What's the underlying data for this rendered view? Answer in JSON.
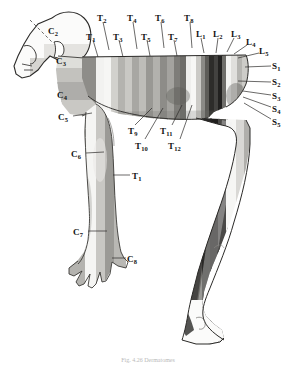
{
  "figure": {
    "background_color": "#ffffff",
    "ink_color": "#141414"
  },
  "caption": {
    "text": "Fig. 4.26  Dermatomes"
  },
  "labels": [
    {
      "id": "C2",
      "root": "C",
      "index": "2",
      "text": "C",
      "sub": "2",
      "x": 48,
      "y": 27,
      "region": "head-scalp",
      "leader": null
    },
    {
      "id": "C3",
      "root": "C",
      "index": "3",
      "text": "C",
      "sub": "3",
      "x": 56,
      "y": 57,
      "region": "neck",
      "leader": null
    },
    {
      "id": "C4",
      "root": "C",
      "index": "4",
      "text": "C",
      "sub": "4",
      "x": 57,
      "y": 91,
      "region": "shoulder-cape",
      "leader": null
    },
    {
      "id": "C5",
      "root": "C",
      "index": "5",
      "text": "C",
      "sub": "5",
      "x": 58,
      "y": 113,
      "region": "upper-arm-lateral",
      "leader": {
        "x1": 73,
        "y1": 116,
        "x2": 92,
        "y2": 113
      }
    },
    {
      "id": "C6",
      "root": "C",
      "index": "6",
      "text": "C",
      "sub": "6",
      "x": 71,
      "y": 150,
      "region": "forearm-radial",
      "leader": {
        "x1": 86,
        "y1": 153,
        "x2": 104,
        "y2": 152
      }
    },
    {
      "id": "C7",
      "root": "C",
      "index": "7",
      "text": "C",
      "sub": "7",
      "x": 73,
      "y": 228,
      "region": "hand-middle",
      "leader": {
        "x1": 88,
        "y1": 231,
        "x2": 107,
        "y2": 231
      }
    },
    {
      "id": "C8",
      "root": "C",
      "index": "8",
      "text": "C",
      "sub": "8",
      "x": 127,
      "y": 255,
      "region": "hand-ulnar",
      "leader": {
        "x1": 112,
        "y1": 258,
        "x2": 126,
        "y2": 258
      }
    },
    {
      "id": "T1",
      "root": "T",
      "index": "1",
      "text": "T",
      "sub": "1",
      "x": 86,
      "y": 33,
      "region": "trunk-band",
      "leader": {
        "x1": 93,
        "y1": 40,
        "x2": 98,
        "y2": 57
      }
    },
    {
      "id": "T2",
      "root": "T",
      "index": "2",
      "text": "T",
      "sub": "2",
      "x": 97,
      "y": 14,
      "region": "trunk-band",
      "leader": {
        "x1": 103,
        "y1": 22,
        "x2": 109,
        "y2": 50
      }
    },
    {
      "id": "T3",
      "root": "T",
      "index": "3",
      "text": "T",
      "sub": "3",
      "x": 113,
      "y": 33,
      "region": "trunk-band",
      "leader": {
        "x1": 119,
        "y1": 40,
        "x2": 123,
        "y2": 57
      }
    },
    {
      "id": "T4",
      "root": "T",
      "index": "4",
      "text": "T",
      "sub": "4",
      "x": 127,
      "y": 14,
      "region": "trunk-band",
      "leader": {
        "x1": 133,
        "y1": 22,
        "x2": 137,
        "y2": 49
      }
    },
    {
      "id": "T5",
      "root": "T",
      "index": "5",
      "text": "T",
      "sub": "5",
      "x": 141,
      "y": 33,
      "region": "trunk-band",
      "leader": {
        "x1": 147,
        "y1": 40,
        "x2": 150,
        "y2": 56
      }
    },
    {
      "id": "T6",
      "root": "T",
      "index": "6",
      "text": "T",
      "sub": "6",
      "x": 155,
      "y": 14,
      "region": "trunk-band",
      "leader": {
        "x1": 161,
        "y1": 22,
        "x2": 164,
        "y2": 48
      }
    },
    {
      "id": "T7",
      "root": "T",
      "index": "7",
      "text": "T",
      "sub": "7",
      "x": 168,
      "y": 33,
      "region": "trunk-band",
      "leader": {
        "x1": 174,
        "y1": 40,
        "x2": 177,
        "y2": 56
      }
    },
    {
      "id": "T8",
      "root": "T",
      "index": "8",
      "text": "T",
      "sub": "8",
      "x": 184,
      "y": 14,
      "region": "trunk-band",
      "leader": {
        "x1": 190,
        "y1": 22,
        "x2": 192,
        "y2": 48
      }
    },
    {
      "id": "T9",
      "root": "T",
      "index": "9",
      "text": "T",
      "sub": "9",
      "x": 128,
      "y": 127,
      "region": "abdomen-band",
      "leader": {
        "x1": 135,
        "y1": 125,
        "x2": 152,
        "y2": 108
      }
    },
    {
      "id": "T10",
      "root": "T",
      "index": "10",
      "text": "T",
      "sub": "10",
      "x": 135,
      "y": 142,
      "region": "abdomen-band",
      "leader": {
        "x1": 145,
        "y1": 139,
        "x2": 163,
        "y2": 108
      }
    },
    {
      "id": "T11",
      "root": "T",
      "index": "11",
      "text": "T",
      "sub": "11",
      "x": 160,
      "y": 127,
      "region": "abdomen-band",
      "leader": {
        "x1": 172,
        "y1": 125,
        "x2": 182,
        "y2": 105
      }
    },
    {
      "id": "T12",
      "root": "T",
      "index": "12",
      "text": "T",
      "sub": "12",
      "x": 168,
      "y": 142,
      "region": "abdomen-band",
      "leader": {
        "x1": 180,
        "y1": 139,
        "x2": 192,
        "y2": 105
      }
    },
    {
      "id": "TL1",
      "root": "T",
      "index": "1",
      "text": "T",
      "sub": "1",
      "x": 132,
      "y": 172,
      "region": "arm-medial-T1",
      "leader": {
        "x1": 130,
        "y1": 175,
        "x2": 113,
        "y2": 175
      }
    },
    {
      "id": "L1",
      "root": "L",
      "index": "1",
      "text": "L",
      "sub": "1",
      "x": 196,
      "y": 30,
      "region": "hip-band",
      "leader": {
        "x1": 201,
        "y1": 38,
        "x2": 204,
        "y2": 53
      }
    },
    {
      "id": "L2",
      "root": "L",
      "index": "2",
      "text": "L",
      "sub": "2",
      "x": 213,
      "y": 30,
      "region": "hip-band",
      "leader": {
        "x1": 218,
        "y1": 38,
        "x2": 216,
        "y2": 53
      }
    },
    {
      "id": "L3",
      "root": "L",
      "index": "3",
      "text": "L",
      "sub": "3",
      "x": 231,
      "y": 30,
      "region": "hip-band",
      "leader": {
        "x1": 234,
        "y1": 38,
        "x2": 227,
        "y2": 52
      }
    },
    {
      "id": "L4",
      "root": "L",
      "index": "4",
      "text": "L",
      "sub": "4",
      "x": 246,
      "y": 38,
      "region": "hip-band",
      "leader": {
        "x1": 247,
        "y1": 45,
        "x2": 234,
        "y2": 54
      }
    },
    {
      "id": "L5",
      "root": "L",
      "index": "5",
      "text": "L",
      "sub": "5",
      "x": 259,
      "y": 47,
      "region": "hip-band",
      "leader": {
        "x1": 259,
        "y1": 53,
        "x2": 238,
        "y2": 58
      }
    },
    {
      "id": "S1",
      "root": "S",
      "index": "1",
      "text": "S",
      "sub": "1",
      "x": 272,
      "y": 62,
      "region": "buttock-band",
      "leader": {
        "x1": 271,
        "y1": 66,
        "x2": 245,
        "y2": 67
      }
    },
    {
      "id": "S2",
      "root": "S",
      "index": "2",
      "text": "S",
      "sub": "2",
      "x": 272,
      "y": 78,
      "region": "buttock-band",
      "leader": {
        "x1": 271,
        "y1": 82,
        "x2": 238,
        "y2": 81
      }
    },
    {
      "id": "S3",
      "root": "S",
      "index": "3",
      "text": "S",
      "sub": "3",
      "x": 272,
      "y": 92,
      "region": "buttock-band",
      "leader": {
        "x1": 271,
        "y1": 95,
        "x2": 243,
        "y2": 91
      }
    },
    {
      "id": "S4",
      "root": "S",
      "index": "4",
      "text": "S",
      "sub": "4",
      "x": 272,
      "y": 105,
      "region": "buttock-band",
      "leader": {
        "x1": 271,
        "y1": 107,
        "x2": 243,
        "y2": 97
      }
    },
    {
      "id": "S5",
      "root": "S",
      "index": "5",
      "text": "S",
      "sub": "5",
      "x": 272,
      "y": 118,
      "region": "buttock-band",
      "leader": {
        "x1": 271,
        "y1": 119,
        "x2": 244,
        "y2": 103
      }
    }
  ],
  "segments": {
    "cervical": [
      "C2",
      "C3",
      "C4",
      "C5",
      "C6",
      "C7",
      "C8"
    ],
    "thoracic": [
      "T1",
      "T2",
      "T3",
      "T4",
      "T5",
      "T6",
      "T7",
      "T8",
      "T9",
      "T10",
      "T11",
      "T12"
    ],
    "lumbar": [
      "L1",
      "L2",
      "L3",
      "L4",
      "L5"
    ],
    "sacral": [
      "S1",
      "S2",
      "S3",
      "S4",
      "S5"
    ]
  },
  "band_tones": {
    "lightest": "#f4f4f2",
    "light": "#d8d7d4",
    "mid_light": "#bdbcb8",
    "mid": "#a2a19d",
    "mid_dark": "#868580",
    "dark": "#5d5c58",
    "darkest": "#2b2a28"
  }
}
